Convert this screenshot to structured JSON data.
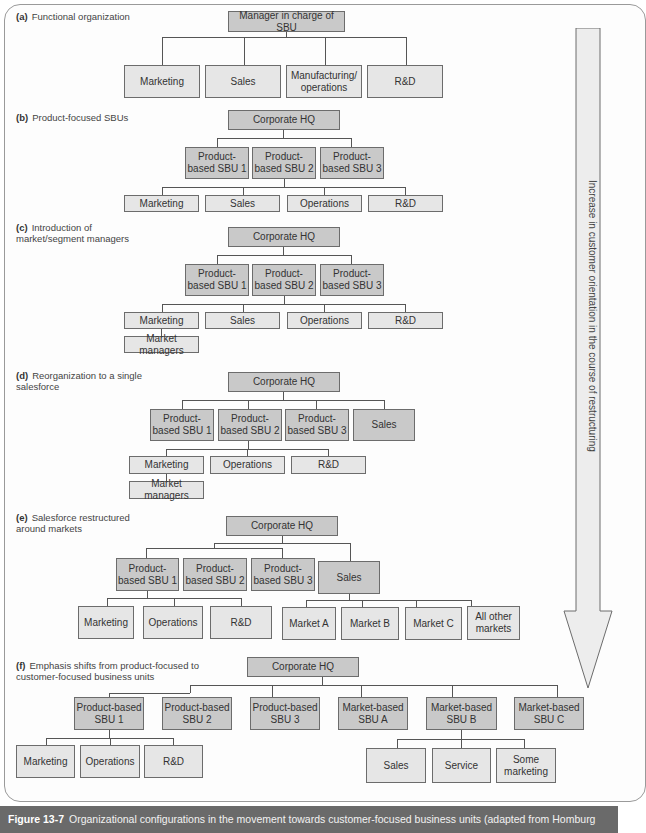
{
  "figure": {
    "caption_label": "Figure 13-7",
    "caption_text": "Organizational configurations in the movement towards customer-focused business units (adapted from Homburg",
    "arrow_label": "Increase in customer orientation in the course of restructuring"
  },
  "sections": {
    "a": {
      "letter": "(a)",
      "title": "Functional organization",
      "root": "Manager in charge of SBU",
      "children": [
        "Marketing",
        "Sales",
        "Manufacturing/ operations",
        "R&D"
      ]
    },
    "b": {
      "letter": "(b)",
      "title": "Product-focused SBUs",
      "root": "Corporate HQ",
      "sbus": [
        "Product-based SBU 1",
        "Product-based SBU 2",
        "Product-based SBU 3"
      ],
      "functions": [
        "Marketing",
        "Sales",
        "Operations",
        "R&D"
      ]
    },
    "c": {
      "letter": "(c)",
      "title": "Introduction of market/segment managers",
      "root": "Corporate HQ",
      "sbus": [
        "Product-based SBU 1",
        "Product-based SBU 2",
        "Product-based SBU 3"
      ],
      "functions": [
        "Marketing",
        "Sales",
        "Operations",
        "R&D"
      ],
      "sub": "Market managers"
    },
    "d": {
      "letter": "(d)",
      "title": "Reorganization to a single salesforce",
      "root": "Corporate HQ",
      "sbus": [
        "Product-based SBU 1",
        "Product-based SBU 2",
        "Product-based SBU 3",
        "Sales"
      ],
      "functions": [
        "Marketing",
        "Operations",
        "R&D"
      ],
      "sub": "Market managers"
    },
    "e": {
      "letter": "(e)",
      "title": "Salesforce restructured around markets",
      "root": "Corporate HQ",
      "sbus": [
        "Product-based SBU 1",
        "Product-based SBU 2",
        "Product-based SBU 3",
        "Sales"
      ],
      "functions": [
        "Marketing",
        "Operations",
        "R&D"
      ],
      "markets": [
        "Market A",
        "Market B",
        "Market C",
        "All other markets"
      ]
    },
    "f": {
      "letter": "(f)",
      "title": "Emphasis shifts from product-focused to customer-focused business units",
      "root": "Corporate HQ",
      "sbus": [
        "Product-based SBU 1",
        "Product-based SBU 2",
        "Product-based SBU 3",
        "Market-based SBU A",
        "Market-based SBU B",
        "Market-based SBU C"
      ],
      "functions": [
        "Marketing",
        "Operations",
        "R&D"
      ],
      "market_functions": [
        "Sales",
        "Service",
        "Some marketing"
      ]
    }
  }
}
